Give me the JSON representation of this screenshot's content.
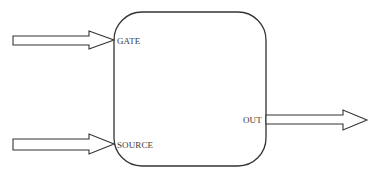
{
  "diagram": {
    "block": {
      "shape": "rounded-rectangle",
      "stroke": "#333333"
    },
    "ports": {
      "gate": {
        "label": "GATE",
        "direction": "input"
      },
      "source": {
        "label": "SOURCE",
        "direction": "input"
      },
      "out": {
        "label": "OUT",
        "direction": "output"
      }
    },
    "arrow_style": {
      "type": "hollow-block-arrow",
      "stroke": "#333333",
      "fill": "#ffffff"
    }
  }
}
